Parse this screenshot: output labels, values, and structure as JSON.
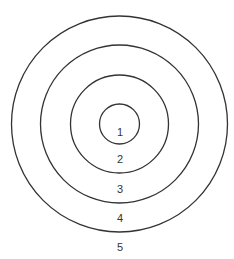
{
  "diagram": {
    "type": "concentric-circles",
    "center": {
      "x": 119.5,
      "y": 124
    },
    "rings": [
      {
        "id": "ring-1",
        "r": 20
      },
      {
        "id": "ring-2",
        "r": 49
      },
      {
        "id": "ring-3",
        "r": 79
      },
      {
        "id": "ring-4",
        "r": 108
      }
    ],
    "labels": [
      {
        "text": "1",
        "x": 120,
        "y": 133
      },
      {
        "text": "2",
        "x": 120,
        "y": 160
      },
      {
        "text": "3",
        "x": 120,
        "y": 190
      },
      {
        "text": "4",
        "x": 120,
        "y": 219
      },
      {
        "text": "5",
        "x": 120,
        "y": 248
      }
    ],
    "stroke_color": "#333333"
  }
}
